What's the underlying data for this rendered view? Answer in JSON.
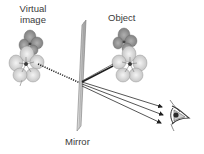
{
  "diagram": {
    "labels": {
      "virtual_image_line1": "Virtual",
      "virtual_image_line2": "image",
      "object": "Object",
      "mirror": "Mirror"
    },
    "elements": [
      {
        "id": "virtual-image",
        "type": "flower-illustration",
        "label": "Virtual image"
      },
      {
        "id": "object",
        "type": "flower-illustration",
        "label": "Object"
      },
      {
        "id": "mirror",
        "type": "plane-mirror",
        "label": "Mirror"
      },
      {
        "id": "eye",
        "type": "eye-icon",
        "label": ""
      }
    ],
    "rays": {
      "incident": {
        "from": "object",
        "to": "mirror",
        "style": "solid"
      },
      "virtual_extension": {
        "from": "mirror",
        "to": "virtual-image",
        "style": "dotted"
      },
      "reflected": {
        "count": 3,
        "from": "mirror",
        "to": "eye",
        "style": "solid-arrow"
      }
    },
    "colors": {
      "ray": "#2a2a2a",
      "mirror_fill": "#c8c8c8",
      "mirror_edge": "#7a7a7a",
      "petal_light": "#e4e4e4",
      "petal_dark": "#9a9a9a",
      "text": "#3a3a3a"
    }
  }
}
